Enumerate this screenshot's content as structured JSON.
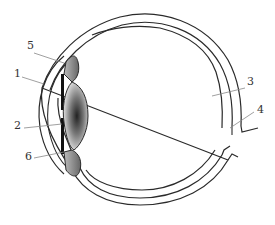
{
  "diagram": {
    "labels": [
      {
        "id": "1",
        "text": "1",
        "x": 14,
        "y": 68
      },
      {
        "id": "2",
        "text": "2",
        "x": 14,
        "y": 120
      },
      {
        "id": "3",
        "text": "3",
        "x": 247,
        "y": 76
      },
      {
        "id": "4",
        "text": "4",
        "x": 257,
        "y": 104
      },
      {
        "id": "5",
        "text": "5",
        "x": 27,
        "y": 40
      },
      {
        "id": "6",
        "text": "6",
        "x": 25,
        "y": 151
      }
    ]
  },
  "colors": {
    "stroke": "#2a2a2a",
    "leader": "#888888",
    "lens_dark": "#2b2b2b",
    "lens_light": "#f2f2f2",
    "body_gray": "#8a8a8a"
  }
}
